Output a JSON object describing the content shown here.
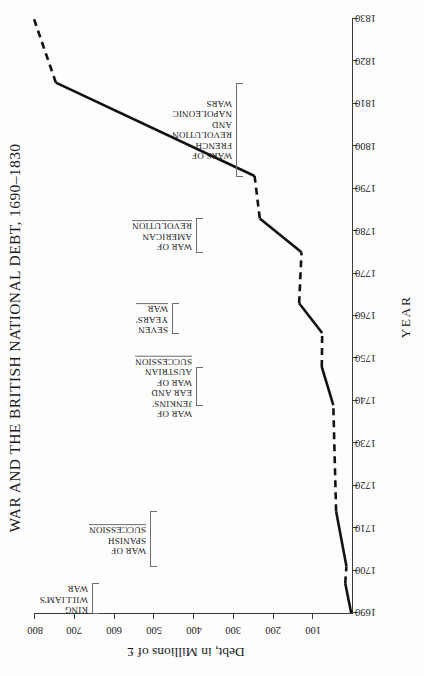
{
  "chart_data": {
    "type": "line",
    "title": "WAR AND THE BRITISH NATIONAL DEBT, 1690–1830",
    "xlabel": "YEAR",
    "ylabel": "Debt, in Millions of £",
    "xlim": [
      1690,
      1830
    ],
    "ylim": [
      0,
      800
    ],
    "xticks": [
      1690,
      1700,
      1710,
      1720,
      1730,
      1740,
      1750,
      1760,
      1770,
      1780,
      1790,
      1800,
      1810,
      1820,
      1830
    ],
    "yticks": [
      100,
      200,
      300,
      400,
      500,
      600,
      700,
      800
    ],
    "grid": false,
    "legend": null,
    "orientation": "rotated-90-ccw",
    "line_color": "#111111",
    "segments": [
      {
        "style": "solid",
        "note": "King William's War",
        "points": [
          [
            1690,
            2
          ],
          [
            1697,
            17
          ]
        ]
      },
      {
        "style": "dashed",
        "note": "peace",
        "points": [
          [
            1697,
            17
          ],
          [
            1701,
            14
          ]
        ]
      },
      {
        "style": "solid",
        "note": "War of Spanish Succession",
        "points": [
          [
            1701,
            14
          ],
          [
            1714,
            40
          ]
        ]
      },
      {
        "style": "dashed",
        "note": "peace",
        "points": [
          [
            1714,
            40
          ],
          [
            1739,
            47
          ]
        ]
      },
      {
        "style": "solid",
        "note": "War of Jenkins' Ear and War of Austrian Succession",
        "points": [
          [
            1739,
            47
          ],
          [
            1748,
            76
          ]
        ]
      },
      {
        "style": "dashed",
        "note": "peace",
        "points": [
          [
            1748,
            76
          ],
          [
            1756,
            75
          ]
        ]
      },
      {
        "style": "solid",
        "note": "Seven Years' War",
        "points": [
          [
            1756,
            75
          ],
          [
            1763,
            133
          ]
        ]
      },
      {
        "style": "dashed",
        "note": "peace",
        "points": [
          [
            1763,
            133
          ],
          [
            1775,
            127
          ]
        ]
      },
      {
        "style": "solid",
        "note": "War of American Revolution",
        "points": [
          [
            1775,
            127
          ],
          [
            1783,
            232
          ]
        ]
      },
      {
        "style": "dashed",
        "note": "peace",
        "points": [
          [
            1783,
            232
          ],
          [
            1793,
            245
          ]
        ]
      },
      {
        "style": "solid",
        "note": "Wars of French Revolution and Napoleonic Wars",
        "points": [
          [
            1793,
            245
          ],
          [
            1815,
            745
          ]
        ]
      },
      {
        "style": "dashed",
        "note": "peace",
        "points": [
          [
            1815,
            745
          ],
          [
            1830,
            800
          ]
        ]
      }
    ],
    "values": [
      {
        "year": 1690,
        "debt": 2
      },
      {
        "year": 1697,
        "debt": 17
      },
      {
        "year": 1701,
        "debt": 14
      },
      {
        "year": 1714,
        "debt": 40
      },
      {
        "year": 1739,
        "debt": 47
      },
      {
        "year": 1748,
        "debt": 76
      },
      {
        "year": 1756,
        "debt": 75
      },
      {
        "year": 1763,
        "debt": 133
      },
      {
        "year": 1775,
        "debt": 127
      },
      {
        "year": 1783,
        "debt": 232
      },
      {
        "year": 1793,
        "debt": 245
      },
      {
        "year": 1815,
        "debt": 745
      },
      {
        "year": 1830,
        "debt": 800
      }
    ],
    "annotations": [
      {
        "id": "king-williams-war",
        "lines": [
          "KING",
          "WILLIAM'S",
          "WAR"
        ],
        "span_start": 1690,
        "span_end": 1697,
        "underline": false
      },
      {
        "id": "war-of-spanish-succession",
        "lines": [
          "WAR OF",
          "SPANISH",
          "SUCCESSION"
        ],
        "span_start": 1701,
        "span_end": 1714,
        "underline": true
      },
      {
        "id": "war-of-jenkins-ear-austrian-succession",
        "lines": [
          "WAR OF",
          "JENKINS'",
          "EAR AND",
          "WAR OF",
          "AUSTRIAN",
          "SUCCESSION"
        ],
        "span_start": 1739,
        "span_end": 1748,
        "underline": true
      },
      {
        "id": "seven-years-war",
        "lines": [
          "SEVEN",
          "YEARS'",
          "WAR"
        ],
        "span_start": 1756,
        "span_end": 1763,
        "underline": true
      },
      {
        "id": "war-of-american-revolution",
        "lines": [
          "WAR OF",
          "AMERICAN",
          "REVOLUTION"
        ],
        "span_start": 1775,
        "span_end": 1783,
        "underline": true
      },
      {
        "id": "wars-of-french-revolution-napoleonic",
        "lines": [
          "WARS OF",
          "FRENCH",
          "REVOLUTION",
          "AND",
          "NAPOLEONIC",
          "WARS"
        ],
        "span_start": 1793,
        "span_end": 1815,
        "underline": false
      }
    ]
  }
}
